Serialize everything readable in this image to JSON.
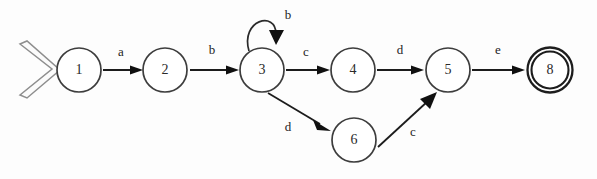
{
  "diagram": {
    "kind": "finite-state-machine",
    "title": "",
    "canvas": {
      "width": 597,
      "height": 179,
      "background": "#fdfdfd"
    },
    "colors": {
      "stroke": "#1c1c1c",
      "state_stroke": "#3d3d3d",
      "accept_stroke": "#1d1d1d",
      "start_marker_stroke": "#8e8e8e",
      "background": "#fdfdfd",
      "label_text": "#232323"
    },
    "start_marker": {
      "name": "start-chevron",
      "shape": "double-outline-chevron",
      "x": 18,
      "y": 70
    },
    "states": [
      {
        "id": "1",
        "label": "1",
        "cx": 79,
        "cy": 70,
        "r": 22,
        "accepting": false
      },
      {
        "id": "2",
        "label": "2",
        "cx": 165,
        "cy": 70,
        "r": 22,
        "accepting": false
      },
      {
        "id": "3",
        "label": "3",
        "cx": 262,
        "cy": 70,
        "r": 22,
        "accepting": false
      },
      {
        "id": "4",
        "label": "4",
        "cx": 353,
        "cy": 70,
        "r": 22,
        "accepting": false
      },
      {
        "id": "5",
        "label": "5",
        "cx": 448,
        "cy": 70,
        "r": 22,
        "accepting": false
      },
      {
        "id": "8",
        "label": "8",
        "cx": 550,
        "cy": 70,
        "r": 22,
        "accepting": true
      },
      {
        "id": "6",
        "label": "6",
        "cx": 354,
        "cy": 140,
        "r": 22,
        "accepting": false
      }
    ],
    "transitions": [
      {
        "from": "1",
        "to": "2",
        "label": "a",
        "label_x": 121,
        "label_y": 53,
        "type": "straight"
      },
      {
        "from": "2",
        "to": "3",
        "label": "b",
        "label_x": 212,
        "label_y": 51,
        "type": "straight"
      },
      {
        "from": "3",
        "to": "3",
        "label": "b",
        "label_x": 284,
        "label_y": 16,
        "type": "self-loop"
      },
      {
        "from": "3",
        "to": "4",
        "label": "c",
        "label_x": 306,
        "label_y": 53,
        "type": "straight"
      },
      {
        "from": "4",
        "to": "5",
        "label": "d",
        "label_x": 400,
        "label_y": 51,
        "type": "straight"
      },
      {
        "from": "5",
        "to": "8",
        "label": "e",
        "label_x": 498,
        "label_y": 51,
        "type": "straight"
      },
      {
        "from": "3",
        "to": "6",
        "label": "d",
        "label_x": 288,
        "label_y": 128,
        "type": "diagonal-down"
      },
      {
        "from": "6",
        "to": "5",
        "label": "c",
        "label_x": 413,
        "label_y": 133,
        "type": "diagonal-up"
      }
    ],
    "alphabet": [
      "a",
      "b",
      "c",
      "d",
      "e"
    ],
    "start_state": "1",
    "accept_states": [
      "8"
    ]
  }
}
